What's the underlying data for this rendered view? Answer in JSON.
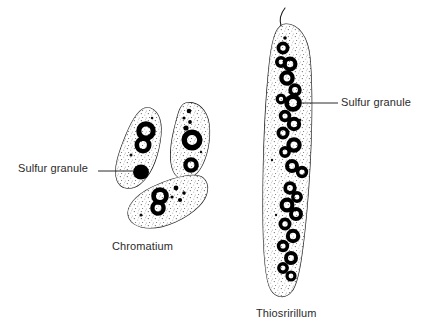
{
  "figure": {
    "background_color": "#ffffff",
    "ink_color": "#1a1a1a",
    "text_color": "#2b2b2b",
    "title": ""
  },
  "labels": {
    "sulfur_granule_left": "Sulfur granule",
    "sulfur_granule_right": "Sulfur granule",
    "chromatium": "Chromatium",
    "thiospirillum": "Thiosririllum"
  },
  "organisms": [
    {
      "name": "Chromatium",
      "shape": "rod",
      "cell_count": 3,
      "arrangement": "cluster",
      "granule_style": "rings-and-solid"
    },
    {
      "name": "Thiosririllum",
      "shape": "elongated-rod",
      "cell_count": 1,
      "arrangement": "single",
      "granule_style": "rings",
      "has_flagellum": true
    }
  ],
  "annotations": [
    {
      "target": "chromatium-solid-granule",
      "text": "Sulfur granule",
      "side": "left"
    },
    {
      "target": "thiospirillum-granule",
      "text": "Sulfur granule",
      "side": "right"
    }
  ]
}
